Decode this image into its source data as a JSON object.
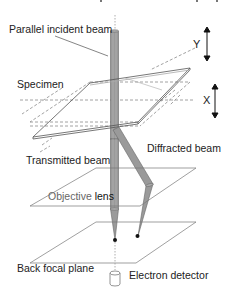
{
  "diagram": {
    "type": "schematic",
    "labels": {
      "incident_beam": "Parallel incident beam",
      "specimen": "Specimen",
      "transmitted_beam": "Transmitted beam",
      "diffracted_beam": "Diffracted beam",
      "objective_lens_part1": "Objective ",
      "objective_lens_part2": "lens",
      "back_focal_plane": "Back focal plane",
      "electron_detector": "Electron detector",
      "axis_y": "Y",
      "axis_x": "X"
    },
    "colors": {
      "line": "#555555",
      "beam_fill": "#9a9a9a",
      "beam_edge": "#666666",
      "dot": "#111111",
      "dashed": "#8a8a8a"
    }
  }
}
